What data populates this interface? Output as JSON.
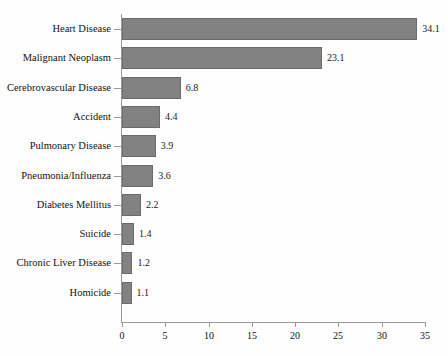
{
  "chart_data": {
    "type": "bar",
    "orientation": "horizontal",
    "title": "",
    "subtitle": "",
    "xlabel": "",
    "ylabel": "",
    "xlim": [
      0,
      35
    ],
    "xticks": [
      0,
      5,
      10,
      15,
      20,
      25,
      30,
      35
    ],
    "xtick_labels": [
      "0",
      "5",
      "10",
      "15",
      "20",
      "25",
      "30",
      "35"
    ],
    "grid": false,
    "legend": false,
    "bar_color": "#828282",
    "bar_edge_color": "#6b6b6b",
    "axis_color": "#9a9a9a",
    "background_color": "#fefefe",
    "categories": [
      "Heart Disease",
      "Malignant Neoplasm",
      "Cerebrovascular Disease",
      "Accident",
      "Pulmonary Disease",
      "Pneumonia/Influenza",
      "Diabetes Mellitus",
      "Suicide",
      "Chronic Liver Disease",
      "Homicide"
    ],
    "values": [
      34.1,
      23.1,
      6.8,
      4.4,
      3.9,
      3.6,
      2.2,
      1.4,
      1.2,
      1.1
    ],
    "value_labels": [
      "34.1",
      "23.1",
      "6.8",
      "4.4",
      "3.9",
      "3.6",
      "2.2",
      "1.4",
      "1.2",
      "1.1"
    ]
  }
}
